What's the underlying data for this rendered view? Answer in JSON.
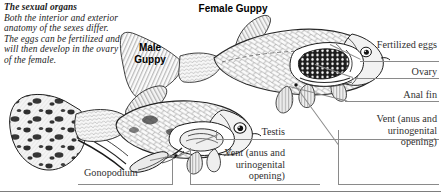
{
  "figure": {
    "caption_title": "The sexual organs",
    "caption_body": "Both the interior and exterior anatomy of the sexes differ. The eggs can be fertilized and will then develop in the ovary of the female.",
    "background_color": "#ffffff",
    "ink_color": "#1a1a1a",
    "rule_color": "#8a8a8a"
  },
  "subjects": {
    "female_label": "Female Guppy",
    "male_label": "Male Guppy"
  },
  "callouts": {
    "fertilized_eggs": "Fertilized eggs",
    "ovary": "Ovary",
    "anal_fin": "Anal fin",
    "vent_female": "Vent (anus and urinogenital opening)",
    "testis": "Testis",
    "vent_male": "Vent (anus and urinogenital opening)",
    "gonopodium": "Gonopodium"
  }
}
